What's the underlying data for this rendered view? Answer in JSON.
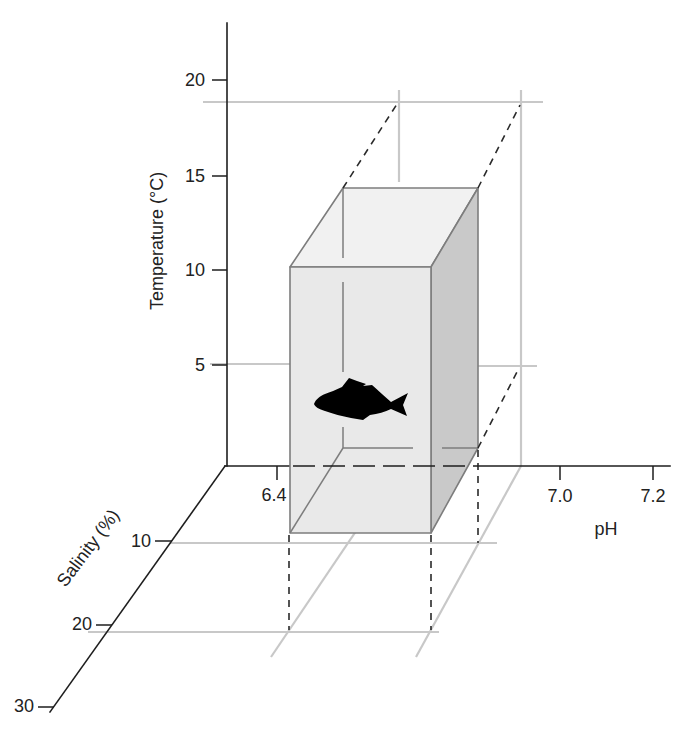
{
  "figure": {
    "axes": {
      "temperature": {
        "label": "Temperature (°C)",
        "ticks": [
          "20",
          "15",
          "10",
          "5"
        ]
      },
      "ph": {
        "label": "pH",
        "ticks": [
          "6.4",
          "7.0",
          "7.2"
        ]
      },
      "salinity": {
        "label": "Salinity (%)",
        "ticks": [
          "10",
          "20",
          "30"
        ]
      }
    },
    "tolerance_volume": {
      "shape": "rectangular-prism",
      "icon": "fish-icon"
    }
  },
  "colors": {
    "axis": "#1e1e1e",
    "grid": "#c8c8c8",
    "dash": "#2a2a2a",
    "box_front": "#e9e9e9",
    "box_top": "#f1f1f1",
    "box_side": "#c9c9c9",
    "box_edge": "#7d7d7d",
    "text": "#222222",
    "fish": "#000000",
    "bg": "#ffffff"
  }
}
